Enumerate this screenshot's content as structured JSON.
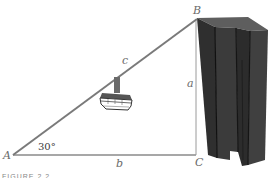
{
  "diagram": {
    "type": "right-triangle word problem",
    "vertices": {
      "A": {
        "label": "A",
        "x": 13,
        "y": 155
      },
      "B": {
        "label": "B",
        "x": 196,
        "y": 20
      },
      "C": {
        "label": "C",
        "x": 196,
        "y": 155
      }
    },
    "sides": {
      "hypotenuse": {
        "label": "c",
        "from": "A",
        "to": "B"
      },
      "vertical": {
        "label": "a",
        "from": "C",
        "to": "B"
      },
      "base": {
        "label": "b",
        "from": "A",
        "to": "C"
      }
    },
    "angle": {
      "vertex": "A",
      "label": "30°"
    },
    "objects": {
      "gondola": "cable car hanging from the hypotenuse cable",
      "building": "tall dark grey skyscraper at right, top at B"
    },
    "colors": {
      "cable": "#7a7a7a",
      "line": "#8a8a8a",
      "building_front": "#3a3a3a",
      "building_top": "#5c5c5c",
      "building_edge": "#111111"
    },
    "caption": "FIGURE 2.2"
  }
}
